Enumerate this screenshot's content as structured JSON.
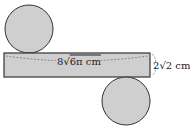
{
  "diagram": {
    "length_label": "8√6π cm",
    "length_coef": "8",
    "length_rad": "6π cm",
    "height_label": "2√2 cm",
    "height_coef": "2",
    "height_rad": "2 cm",
    "colors": {
      "fill": "#cfcfcf",
      "stroke": "#333333"
    }
  }
}
